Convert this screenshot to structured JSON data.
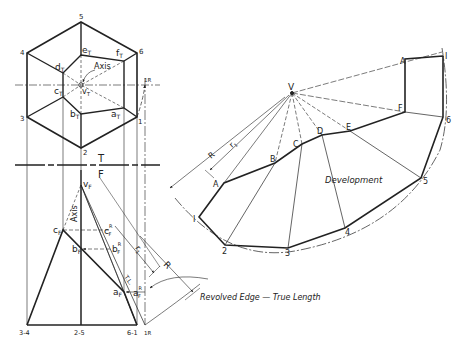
{
  "figure": {
    "top_view": {
      "vertex_labels": [
        "5",
        "6",
        "1",
        "2",
        "3",
        "4"
      ],
      "point_labels": {
        "e": "e",
        "f": "f",
        "d": "d",
        "c": "c",
        "b": "b",
        "a": "a",
        "v": "v"
      },
      "subscript": "T",
      "axis_label": "Axis",
      "revolve_label": "1R"
    },
    "reference_line": {
      "top": "T",
      "bottom": "F"
    },
    "front_view": {
      "apex": "v",
      "apex_sub": "F",
      "points": {
        "c": "c",
        "b": "b",
        "a": "a"
      },
      "subscript": "F",
      "revolved": {
        "c": "c",
        "b": "b",
        "a": "a",
        "sup": "R",
        "sub": "F"
      },
      "axis_label": "Axis",
      "base_labels": [
        "3-4",
        "2-5",
        "6-1",
        "1R"
      ],
      "r_label": "r",
      "r_sub": "1",
      "tl_label": "T.L.",
      "R_label": "R",
      "callout": "Revolved Edge — True Length"
    },
    "development": {
      "title": "Development",
      "apex": "V",
      "upper_labels": [
        "A",
        "B",
        "C",
        "D",
        "E",
        "F",
        "A"
      ],
      "lower_labels": [
        "I",
        "2",
        "3",
        "4",
        "5",
        "6",
        "I"
      ],
      "R_label": "R",
      "r_label": "r",
      "r_sub": "1"
    }
  }
}
